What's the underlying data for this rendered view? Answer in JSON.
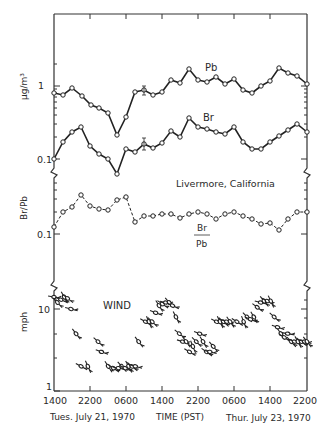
{
  "chart_data": {
    "type": "line",
    "title": "",
    "location_label": "Livermore, California",
    "xlabel": "TIME (PST)",
    "x_ticks": [
      "1400",
      "2200",
      "0600",
      "1400",
      "2200",
      "0600",
      "1400",
      "2200"
    ],
    "x_date_labels": {
      "left": "Tues. July 21, 1970",
      "right": "Thur. July 23, 1970"
    },
    "x_range": [
      "1400 Tue July 21 1970",
      "2200 Thu July 23 1970"
    ],
    "grid": false,
    "panels": [
      {
        "name": "concentration",
        "ylabel": "μg/m³",
        "y_scale": "log",
        "y_ticks": [
          "1",
          "0.1"
        ],
        "ylim": [
          0.05,
          5
        ],
        "series": [
          {
            "name": "Pb",
            "style": "solid line, open circles",
            "x_hours_from_start": [
              0,
              2.7,
              5.3,
              8,
              10.7,
              13.3,
              16,
              18.7,
              21.3,
              24,
              26.7,
              29.3,
              32,
              34.7,
              37.3,
              40,
              42.7,
              45.3,
              48,
              50.7,
              53.3,
              56,
              58.7,
              61.3,
              64,
              66.7,
              69.3,
              72,
              74.7
            ],
            "values": [
              0.8,
              0.75,
              0.94,
              0.73,
              0.55,
              0.5,
              0.43,
              0.22,
              0.39,
              0.82,
              0.86,
              0.75,
              0.82,
              1.2,
              1.1,
              1.6,
              1.2,
              1.1,
              1.3,
              1.03,
              1.2,
              0.86,
              0.79,
              0.98,
              1.15,
              1.7,
              1.5,
              1.35,
              1.03
            ]
          },
          {
            "name": "Br",
            "style": "solid line, open circles",
            "x_hours_from_start": [
              0,
              2.7,
              5.3,
              8,
              10.7,
              13.3,
              16,
              18.7,
              21.3,
              24,
              26.7,
              29.3,
              32,
              34.7,
              37.3,
              40,
              42.7,
              45.3,
              48,
              50.7,
              53.3,
              56,
              58.7,
              61.3,
              64,
              66.7,
              69.3,
              72,
              74.7
            ],
            "values": [
              0.1,
              0.17,
              0.23,
              0.27,
              0.15,
              0.12,
              0.1,
              0.066,
              0.14,
              0.13,
              0.16,
              0.145,
              0.17,
              0.25,
              0.21,
              0.38,
              0.29,
              0.27,
              0.25,
              0.23,
              0.29,
              0.18,
              0.145,
              0.145,
              0.18,
              0.22,
              0.26,
              0.31,
              0.24
            ]
          }
        ],
        "annotations": [
          "Pb",
          "Br",
          "error bar near x=1200 Wed"
        ]
      },
      {
        "name": "ratio",
        "ylabel": "Br/Pb",
        "y_scale": "log",
        "y_ticks": [
          "0.1"
        ],
        "series": [
          {
            "name": "Br/Pb",
            "style": "dashed line, open circles",
            "x_hours_from_start": [
              0,
              2.7,
              5.3,
              8,
              10.7,
              13.3,
              16,
              18.7,
              21.3,
              24,
              26.7,
              29.3,
              32,
              34.7,
              37.3,
              40,
              42.7,
              45.3,
              48,
              50.7,
              53.3,
              56,
              58.7,
              61.3,
              64,
              66.7,
              69.3,
              72,
              74.7
            ],
            "values": [
              0.12,
              0.2,
              0.24,
              0.35,
              0.25,
              0.23,
              0.22,
              0.3,
              0.33,
              0.14,
              0.17,
              0.17,
              0.18,
              0.18,
              0.16,
              0.18,
              0.19,
              0.18,
              0.155,
              0.18,
              0.19,
              0.17,
              0.155,
              0.13,
              0.135,
              0.11,
              0.155,
              0.19,
              0.19
            ]
          }
        ],
        "annotations": [
          "Br / Pb"
        ]
      },
      {
        "name": "wind",
        "ylabel": "mph",
        "y_scale": "log",
        "y_ticks": [
          "10",
          "1"
        ],
        "ylim": [
          1,
          20
        ],
        "series": [
          {
            "name": "WIND",
            "style": "wind direction arrows (feathered), circle at speed",
            "x_hours_from_start": [
              0,
              1,
              2,
              3,
              4,
              5,
              6.5,
              8,
              10,
              13,
              14,
              16,
              17.5,
              19,
              20,
              21,
              22,
              23,
              24,
              25,
              27,
              28,
              29,
              30,
              31,
              32,
              33,
              34,
              35,
              36,
              37,
              38,
              39,
              40,
              41,
              42,
              43,
              44,
              45,
              46,
              47,
              48,
              49,
              50,
              51,
              52,
              54,
              56,
              57,
              58,
              59,
              60,
              61,
              62,
              63,
              64,
              65,
              66,
              67,
              68,
              69,
              70,
              71,
              72,
              73,
              74,
              74.7
            ],
            "values": [
              14,
              12,
              13,
              14,
              13.5,
              10,
              5,
              2,
              2,
              4,
              3,
              2,
              1.9,
              1.9,
              2,
              1.9,
              2,
              2,
              2,
              4,
              7,
              7,
              7,
              9,
              11,
              11.5,
              12,
              12,
              11,
              8,
              5,
              4,
              4,
              3,
              3.5,
              4,
              5,
              4,
              3,
              3,
              3.5,
              7,
              7,
              7,
              7,
              7,
              7,
              7,
              8,
              7.5,
              8,
              10.5,
              12,
              12.5,
              12.5,
              12.5,
              8,
              6,
              5,
              4.5,
              5,
              4,
              4,
              4,
              4,
              4,
              4,
              4
            ]
          }
        ],
        "annotations": [
          "WIND"
        ]
      }
    ]
  }
}
